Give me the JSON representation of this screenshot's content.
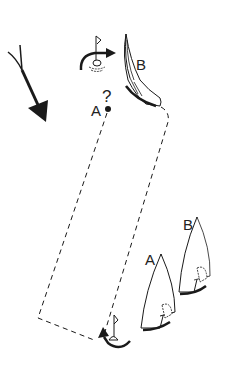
{
  "diagram": {
    "type": "sailing-race-rules-diagram",
    "labels": {
      "boat_b_top": "B",
      "boat_a_top": "A",
      "question_mark": "?",
      "boat_a_bottom": "A",
      "boat_b_bottom": "B"
    },
    "elements": [
      {
        "name": "wind-arrow",
        "description": "Large arrow indicating wind direction, pointing down-right"
      },
      {
        "name": "upper-mark",
        "description": "Mark buoy with flag and curved rounding arrow (clockwise)"
      },
      {
        "name": "boat-b-heeled",
        "description": "Boat B rounding upper mark, heeled"
      },
      {
        "name": "boat-a-position",
        "description": "Point A with question mark"
      },
      {
        "name": "lower-mark",
        "description": "Mark buoy with flag and curved rounding arrow (counter-clockwise)"
      },
      {
        "name": "boat-a-lower",
        "description": "Boat A sailing near lower mark"
      },
      {
        "name": "boat-b-lower",
        "description": "Boat B sailing ahead to windward"
      },
      {
        "name": "dashed-course-paths",
        "description": "Dashed lines showing track of boats from lower mark to upper mark"
      }
    ],
    "colors": {
      "ink": "#1a1a1a",
      "background": "#ffffff"
    }
  }
}
